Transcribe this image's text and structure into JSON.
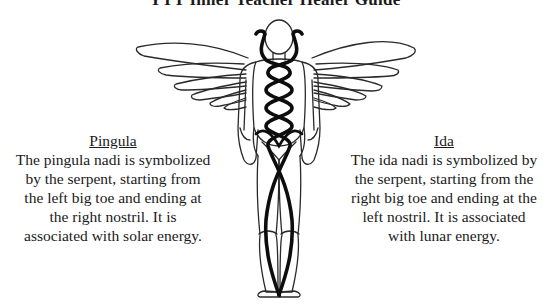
{
  "title": "YTT Inner Teacher Healer Guide",
  "figure": {
    "name": "caduceus-body-figure",
    "colors": {
      "outline": "#2a2a2a",
      "serpent": "#0d0d0d",
      "background": "#ffffff"
    }
  },
  "pingula": {
    "heading": "Pingula",
    "lines": [
      "The pingula nadi is symbolized",
      "by the serpent, starting from",
      "the left big toe and ending at",
      "the right nostril.  It is",
      "associated with solar energy."
    ]
  },
  "ida": {
    "heading": "Ida",
    "lines": [
      "The ida nadi is symbolized by",
      "the serpent, starting from the",
      "right big toe and ending at the",
      "left nostril.  It is associated",
      "with lunar energy."
    ]
  }
}
